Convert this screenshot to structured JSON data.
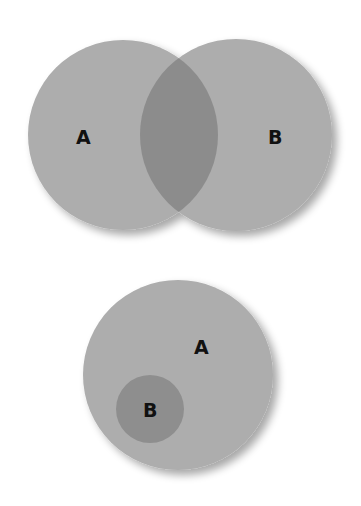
{
  "diagrams": [
    {
      "type": "overlapping-venn",
      "sets": [
        {
          "label": "A",
          "cx": 123,
          "cy": 135,
          "r": 95
        },
        {
          "label": "B",
          "cx": 236,
          "cy": 135,
          "r": 96
        }
      ],
      "labels": {
        "a": "A",
        "b": "B"
      }
    },
    {
      "type": "subset-venn",
      "sets": [
        {
          "label": "A",
          "cx": 178,
          "cy": 375,
          "r": 95
        },
        {
          "label": "B",
          "cx": 150,
          "cy": 409,
          "r": 34
        }
      ],
      "labels": {
        "a": "A",
        "b": "B"
      }
    }
  ],
  "colors": {
    "circle": "#adadad",
    "overlap": "#8c8c8c",
    "inner": "#8e8e8e",
    "shadow": "#cfcfcf"
  }
}
